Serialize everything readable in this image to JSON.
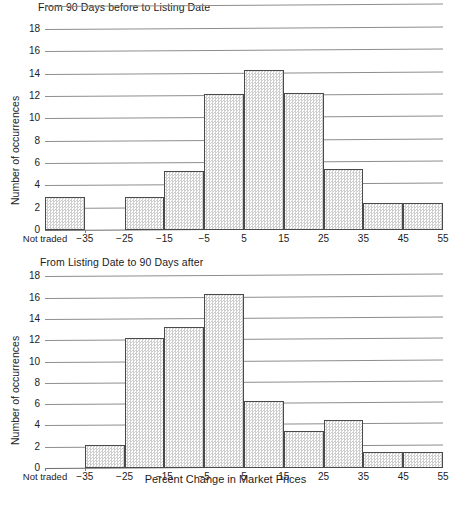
{
  "figure": {
    "y_axis_title": "Number of occurrences",
    "x_axis_title": "Percent Change in Market Prices",
    "y_ticks": [
      "0",
      "2",
      "4",
      "6",
      "8",
      "10",
      "12",
      "14",
      "16",
      "18"
    ],
    "x_ticks": [
      "Not traded",
      "−35",
      "−25",
      "−15",
      "−5",
      "5",
      "15",
      "25",
      "35",
      "45",
      "55"
    ],
    "panels": [
      {
        "id": "top",
        "title": "From 90 Days before to Listing Date"
      },
      {
        "id": "bottom",
        "title": "From Listing Date to 90 Days after"
      }
    ]
  },
  "chart_data": [
    {
      "type": "bar",
      "title": "From 90 Days before to Listing Date",
      "xlabel": "",
      "ylabel": "Number of occurrences",
      "ylim": [
        0,
        19
      ],
      "yticks": [
        0,
        2,
        4,
        6,
        8,
        10,
        12,
        14,
        16,
        18
      ],
      "grid": true,
      "legend": "none",
      "categories": [
        "Not traded",
        "−35 to −25",
        "−25 to −15",
        "−15 to −5",
        "−5 to 5",
        "5 to 15",
        "15 to 25",
        "25 to 35",
        "35 to 45",
        "45 to 55"
      ],
      "values": [
        3,
        0,
        3,
        5.3,
        12.2,
        14.3,
        12.3,
        5.5,
        2.4,
        2.4
      ]
    },
    {
      "type": "bar",
      "title": "From Listing Date to 90 Days after",
      "xlabel": "Percent Change in Market Prices",
      "ylabel": "Number of occurrences",
      "ylim": [
        0,
        18.5
      ],
      "yticks": [
        0,
        2,
        4,
        6,
        8,
        10,
        12,
        14,
        16,
        18
      ],
      "grid": true,
      "legend": "none",
      "categories": [
        "Not traded",
        "−35 to −25",
        "−25 to −15",
        "−15 to −5",
        "−5 to 5",
        "5 to 15",
        "15 to 25",
        "25 to 35",
        "35 to 45",
        "45 to 55"
      ],
      "values": [
        0,
        2.2,
        12.2,
        13.2,
        16.3,
        6.3,
        3.5,
        4.5,
        1.5,
        1.5
      ]
    }
  ]
}
